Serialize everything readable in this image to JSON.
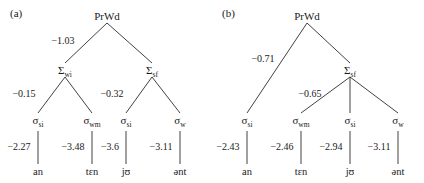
{
  "figure": {
    "background_color": "#ffffff",
    "line_color": "#2b2b2b",
    "text_color": "#1a1a1a"
  },
  "panels": [
    {
      "id": "a",
      "label": "(a)",
      "root": {
        "text": "PrWd",
        "x": 107,
        "y": 16
      },
      "nodes": [
        {
          "name": "foot-wi",
          "base": "Σ",
          "sub": "wi",
          "x": 65,
          "y": 70
        },
        {
          "name": "foot-sf",
          "base": "Σ",
          "sub": "sf",
          "x": 152,
          "y": 70
        },
        {
          "name": "syll-1",
          "base": "σ",
          "sub": "si",
          "x": 38,
          "y": 120
        },
        {
          "name": "syll-2",
          "base": "σ",
          "sub": "wm",
          "x": 92,
          "y": 120
        },
        {
          "name": "syll-3",
          "base": "σ",
          "sub": "si",
          "x": 126,
          "y": 120
        },
        {
          "name": "syll-4",
          "base": "σ",
          "sub": "w",
          "x": 180,
          "y": 120
        }
      ],
      "leaves": [
        {
          "name": "leaf-an",
          "text": "an",
          "x": 38,
          "y": 172
        },
        {
          "name": "leaf-ten",
          "text": "tɛn",
          "x": 92,
          "y": 172
        },
        {
          "name": "leaf-ju",
          "text": "jʊ",
          "x": 126,
          "y": 172
        },
        {
          "name": "leaf-ent",
          "text": "ənt",
          "x": 180,
          "y": 172
        }
      ],
      "edges": [
        {
          "name": "edge-root-footwi",
          "x1": 107,
          "y1": 23,
          "x2": 65,
          "y2": 63
        },
        {
          "name": "edge-root-footsf",
          "x1": 107,
          "y1": 23,
          "x2": 152,
          "y2": 63
        },
        {
          "name": "edge-footwi-s1",
          "x1": 65,
          "y1": 77,
          "x2": 38,
          "y2": 113
        },
        {
          "name": "edge-footwi-s2",
          "x1": 65,
          "y1": 77,
          "x2": 92,
          "y2": 113
        },
        {
          "name": "edge-footsf-s3",
          "x1": 152,
          "y1": 77,
          "x2": 126,
          "y2": 113
        },
        {
          "name": "edge-footsf-s4",
          "x1": 152,
          "y1": 77,
          "x2": 180,
          "y2": 113
        },
        {
          "name": "edge-s1-leaf",
          "x1": 38,
          "y1": 131,
          "x2": 38,
          "y2": 164
        },
        {
          "name": "edge-s2-leaf",
          "x1": 92,
          "y1": 131,
          "x2": 92,
          "y2": 164
        },
        {
          "name": "edge-s3-leaf",
          "x1": 126,
          "y1": 131,
          "x2": 126,
          "y2": 164
        },
        {
          "name": "edge-s4-leaf",
          "x1": 180,
          "y1": 131,
          "x2": 180,
          "y2": 164
        }
      ],
      "weights": [
        {
          "name": "weight-root-footwi",
          "text": "−1.03",
          "x": 63,
          "y": 41
        },
        {
          "name": "weight-footwi-s1",
          "text": "−0.15",
          "x": 24,
          "y": 94
        },
        {
          "name": "weight-footsf-s3",
          "text": "−0.32",
          "x": 112,
          "y": 94
        },
        {
          "name": "weight-s1-leaf",
          "text": "−2.27",
          "x": 19,
          "y": 147
        },
        {
          "name": "weight-s2-leaf",
          "text": "−3.48",
          "x": 73,
          "y": 147
        },
        {
          "name": "weight-s3-leaf",
          "text": "−3.6",
          "x": 110,
          "y": 147
        },
        {
          "name": "weight-s4-leaf",
          "text": "−3.11",
          "x": 161,
          "y": 147
        }
      ]
    },
    {
      "id": "b",
      "label": "(b)",
      "root": {
        "text": "PrWd",
        "x": 95,
        "y": 16
      },
      "nodes": [
        {
          "name": "foot-sf",
          "base": "Σ",
          "sub": "sf",
          "x": 138,
          "y": 70
        },
        {
          "name": "syll-1",
          "base": "σ",
          "sub": "si",
          "x": 35,
          "y": 120
        },
        {
          "name": "syll-2",
          "base": "σ",
          "sub": "wm",
          "x": 89,
          "y": 120
        },
        {
          "name": "syll-3",
          "base": "σ",
          "sub": "si",
          "x": 138,
          "y": 120
        },
        {
          "name": "syll-4",
          "base": "σ",
          "sub": "w",
          "x": 186,
          "y": 120
        }
      ],
      "leaves": [
        {
          "name": "leaf-an",
          "text": "an",
          "x": 35,
          "y": 172
        },
        {
          "name": "leaf-ten",
          "text": "tɛn",
          "x": 89,
          "y": 172
        },
        {
          "name": "leaf-ju",
          "text": "jʊ",
          "x": 138,
          "y": 172
        },
        {
          "name": "leaf-ent",
          "text": "ənt",
          "x": 186,
          "y": 172
        }
      ],
      "edges": [
        {
          "name": "edge-root-s1",
          "x1": 95,
          "y1": 23,
          "x2": 35,
          "y2": 113
        },
        {
          "name": "edge-root-footsf",
          "x1": 95,
          "y1": 23,
          "x2": 138,
          "y2": 63
        },
        {
          "name": "edge-footsf-s2",
          "x1": 138,
          "y1": 77,
          "x2": 89,
          "y2": 113
        },
        {
          "name": "edge-footsf-s3",
          "x1": 138,
          "y1": 77,
          "x2": 138,
          "y2": 113
        },
        {
          "name": "edge-footsf-s4",
          "x1": 138,
          "y1": 77,
          "x2": 186,
          "y2": 113
        },
        {
          "name": "edge-s1-leaf",
          "x1": 35,
          "y1": 131,
          "x2": 35,
          "y2": 164
        },
        {
          "name": "edge-s2-leaf",
          "x1": 89,
          "y1": 131,
          "x2": 89,
          "y2": 164
        },
        {
          "name": "edge-s3-leaf",
          "x1": 138,
          "y1": 131,
          "x2": 138,
          "y2": 164
        },
        {
          "name": "edge-s4-leaf",
          "x1": 186,
          "y1": 131,
          "x2": 186,
          "y2": 164
        }
      ],
      "weights": [
        {
          "name": "weight-root-s1",
          "text": "−0.71",
          "x": 51,
          "y": 59
        },
        {
          "name": "weight-footsf-s2",
          "text": "−0.65",
          "x": 98,
          "y": 94
        },
        {
          "name": "weight-s1-leaf",
          "text": "−2.43",
          "x": 16,
          "y": 147
        },
        {
          "name": "weight-s2-leaf",
          "text": "−2.46",
          "x": 70,
          "y": 147
        },
        {
          "name": "weight-s3-leaf",
          "text": "−2.94",
          "x": 119,
          "y": 147
        },
        {
          "name": "weight-s4-leaf",
          "text": "−3.11",
          "x": 167,
          "y": 147
        }
      ]
    }
  ],
  "panel_label_positions": [
    {
      "x": 10,
      "y": 14
    },
    {
      "x": 10,
      "y": 14
    }
  ]
}
